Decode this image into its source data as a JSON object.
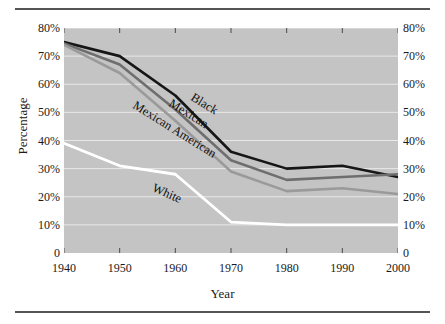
{
  "figure": {
    "has_top_rule": true,
    "has_bottom_rule": true,
    "plot_background": "#c4c4c4",
    "gridline_color": "#e8e8e8"
  },
  "chart_data": {
    "type": "line",
    "title": "",
    "xlabel": "Year",
    "ylabel": "Percentage",
    "x": [
      1940,
      1950,
      1960,
      1970,
      1980,
      1990,
      2000
    ],
    "xtick_labels": [
      "1940",
      "1950",
      "1960",
      "1970",
      "1980",
      "1990",
      "2000"
    ],
    "xlim": [
      1940,
      2000
    ],
    "ylim": [
      0,
      80
    ],
    "ytick_values": [
      0,
      10,
      20,
      30,
      40,
      50,
      60,
      70,
      80
    ],
    "ytick_labels": [
      "0",
      "10%",
      "20%",
      "30%",
      "40%",
      "50%",
      "60%",
      "70%",
      "80%"
    ],
    "ytick_labels_right": [
      "0",
      "10%",
      "20%",
      "30%",
      "40%",
      "50%",
      "60%",
      "70%",
      "80%"
    ],
    "grid": true,
    "grid_axis": "y",
    "legend": "inline-labels",
    "series": [
      {
        "name": "Black",
        "color": "#161616",
        "width": 2.6,
        "values": [
          75,
          70,
          56,
          36,
          30,
          31,
          27
        ],
        "label_x": 1963,
        "label_y": 58,
        "label_angle": 32
      },
      {
        "name": "Mexican",
        "color": "#6e6e6e",
        "width": 2.6,
        "values": [
          74.5,
          67,
          51,
          33,
          26,
          27,
          28
        ],
        "label_x": 1959,
        "label_y": 56,
        "label_angle": 32
      },
      {
        "name": "Mexican American",
        "color": "#9a9a9a",
        "width": 2.6,
        "values": [
          74,
          64,
          47,
          29,
          22,
          23,
          21
        ],
        "label_x": 1952.5,
        "label_y": 55,
        "label_angle": 32
      },
      {
        "name": "White",
        "color": "#ffffff",
        "width": 2.8,
        "values": [
          39,
          31,
          28,
          11,
          10,
          10,
          10
        ],
        "label_x": 1956,
        "label_y": 25.5,
        "label_angle": 24
      }
    ]
  }
}
